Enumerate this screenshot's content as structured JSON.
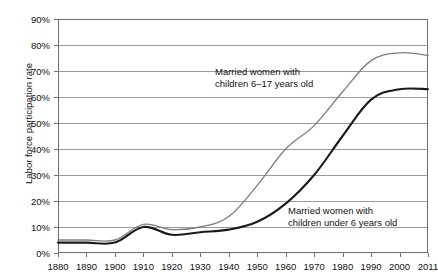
{
  "figure": {
    "title_remnant": "",
    "ylabel": "Labor force participation rate",
    "series_colors": {
      "older_children": "#7d7d7d",
      "under_six": "#1a1a1a"
    }
  },
  "annotations": {
    "gray": {
      "line1": "Married women with",
      "line2": "children 6–17 years old"
    },
    "black": {
      "line1": "Married women with",
      "line2": "children under 6 years old"
    }
  },
  "axis": {
    "y_ticks": [
      "0%",
      "10%",
      "20%",
      "30%",
      "40%",
      "50%",
      "60%",
      "70%",
      "80%",
      "90%"
    ],
    "x_ticks": [
      "1880",
      "1890",
      "1900",
      "1910",
      "1920",
      "1930",
      "1940",
      "1950",
      "1960",
      "1970",
      "1980",
      "1990",
      "2000",
      "2011"
    ]
  },
  "chart_data": {
    "type": "line",
    "title": "",
    "xlabel": "",
    "ylabel": "Labor force participation rate",
    "xlim": [
      1880,
      2011
    ],
    "ylim": [
      0,
      90
    ],
    "grid": "horizontal",
    "legend": "inline-annotations",
    "x": [
      1880,
      1890,
      1900,
      1910,
      1920,
      1930,
      1940,
      1950,
      1960,
      1970,
      1980,
      1990,
      2000,
      2011
    ],
    "series": [
      {
        "name": "Married women with children 6–17 years old",
        "color": "#7d7d7d",
        "values": [
          5,
          5,
          5,
          11,
          9,
          10,
          14,
          26,
          40,
          49,
          62,
          74,
          77,
          76
        ]
      },
      {
        "name": "Married women with children under 6 years old",
        "color": "#1a1a1a",
        "values": [
          4,
          4,
          4,
          10,
          7,
          8,
          9,
          12,
          19,
          30,
          45,
          59,
          63,
          63
        ]
      }
    ]
  }
}
